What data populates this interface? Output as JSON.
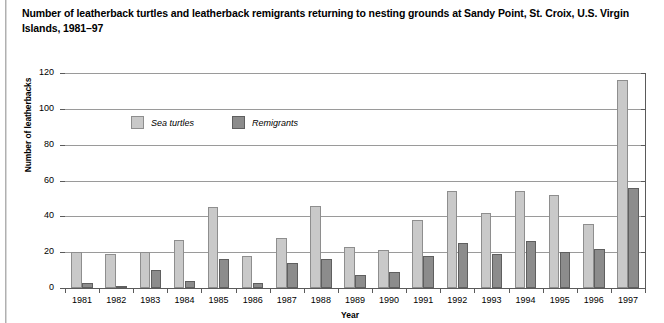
{
  "figure": {
    "title": "Number of leatherback turtles and leatherback remigrants returning to nesting grounds at Sandy Point, St. Croix, U.S. Virgin Islands, 1981–97"
  },
  "legend": {
    "position": "inside-top-left",
    "entries": [
      {
        "label": "Sea turtles",
        "color": "#c9c9c9"
      },
      {
        "label": "Remigrants",
        "color": "#8c8c8c"
      }
    ]
  },
  "chart_data": {
    "type": "bar",
    "title": "Number of leatherback turtles and leatherback remigrants returning to nesting grounds at Sandy Point, St. Croix, U.S. Virgin Islands, 1981–97",
    "xlabel": "Year",
    "ylabel": "Number of leatherbacks",
    "ylim": [
      0,
      120
    ],
    "yticks": [
      0,
      20,
      40,
      60,
      80,
      100,
      120
    ],
    "grid": true,
    "categories": [
      "1981",
      "1982",
      "1983",
      "1984",
      "1985",
      "1986",
      "1987",
      "1988",
      "1989",
      "1990",
      "1991",
      "1992",
      "1993",
      "1994",
      "1995",
      "1996",
      "1997"
    ],
    "series": [
      {
        "name": "Sea turtles",
        "color": "#c9c9c9",
        "values": [
          20,
          19,
          20,
          27,
          45,
          18,
          28,
          46,
          23,
          21,
          38,
          54,
          42,
          54,
          52,
          36,
          116
        ]
      },
      {
        "name": "Remigrants",
        "color": "#8c8c8c",
        "values": [
          3,
          1,
          10,
          4,
          16,
          3,
          14,
          16,
          7,
          9,
          18,
          25,
          19,
          26,
          20,
          22,
          56
        ]
      }
    ]
  }
}
